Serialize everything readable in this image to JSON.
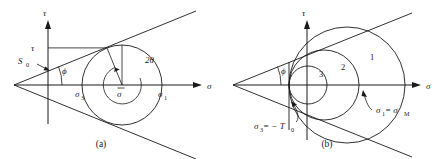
{
  "figure": {
    "title_caption_a": "(a)",
    "title_caption_b": "(b)",
    "colors": {
      "ink": "#1a1a1a",
      "background": "#ffffff"
    }
  },
  "panel_a": {
    "caption": "(a)",
    "axis_tau_label": "τ",
    "axis_sigma_label": "σ",
    "tick_tau_label": "τ",
    "label_s0": "S",
    "label_s0_sub": "0",
    "label_phi": "ϕ",
    "label_two_theta": "2θ",
    "label_sigma3": "σ",
    "label_sigma3_sub": "3",
    "label_sigma_mean": "σ",
    "label_sigma1": "σ",
    "label_sigma1_sub": "1",
    "geometry": {
      "apex_x": 14,
      "apex_y": 85,
      "tau_axis_x": 48,
      "sigma_axis_y": 85,
      "circle_center_x": 122,
      "circle_center_y": 85,
      "circle_radius": 40,
      "friction_angle_deg": 22
    }
  },
  "panel_b": {
    "caption": "(b)",
    "axis_tau_label": "τ",
    "axis_sigma_label": "σ",
    "label_phi": "ϕ",
    "circle_labels": [
      "1",
      "2",
      "3"
    ],
    "label_sigma3_cutoff": "σ",
    "label_sigma3_cutoff_sub": "3",
    "label_sigma3_cutoff_rest": " = − T",
    "label_sigma3_cutoff_rest_sub": "0",
    "label_sigma1_max": "σ",
    "label_sigma1_max_sub": "1",
    "label_sigma1_max_mid": " = σ",
    "label_sigma1_max_sub2": "M",
    "geometry": {
      "apex_x": 233,
      "apex_y": 85,
      "tau_axis_x": 307,
      "sigma_axis_y": 85,
      "cutoff_line_x": 289,
      "friction_angle_deg": 22,
      "circles": [
        {
          "name": "1",
          "center_x": 347,
          "radius": 58
        },
        {
          "name": "2",
          "center_x": 324,
          "radius": 35
        },
        {
          "name": "3",
          "center_x": 308,
          "radius": 19
        }
      ]
    }
  }
}
